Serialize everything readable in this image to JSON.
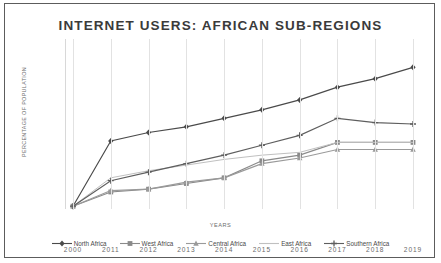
{
  "chart_data": {
    "type": "line",
    "title": "INTERNET USERS:  AFRICAN SUB-REGIONS",
    "xlabel": "YEARS",
    "ylabel": "PERCENTAGE OF POPULATION",
    "categories": [
      "2000",
      "2011",
      "2012",
      "2013",
      "2014",
      "2015",
      "2016",
      "2017",
      "2018",
      "2019"
    ],
    "yticks": [
      "0",
      "10",
      "20",
      "30",
      "40",
      "50",
      "60"
    ],
    "ylim": [
      0,
      60
    ],
    "grid": "vertical",
    "legend_position": "bottom",
    "series": [
      {
        "name": "North Africa",
        "marker": "diamond",
        "color": "#4a4a4a",
        "values": [
          1,
          24,
          27,
          29,
          32,
          35,
          38.5,
          43,
          46,
          50
        ]
      },
      {
        "name": "West Africa",
        "marker": "square",
        "color": "#8a8a8a",
        "values": [
          1,
          6,
          7,
          9,
          11,
          17,
          19,
          23.5,
          23.5,
          23.5
        ]
      },
      {
        "name": "Central Africa",
        "marker": "triangle",
        "color": "#9a9a9a",
        "values": [
          1,
          6.5,
          7,
          9.5,
          11,
          16,
          18,
          21,
          21,
          21
        ]
      },
      {
        "name": "East Africa",
        "marker": "none",
        "color": "#c0c0c0",
        "values": [
          1,
          11,
          13.5,
          15.5,
          17.5,
          19,
          20,
          23.5,
          23.5,
          23.5
        ]
      },
      {
        "name": "Southern Africa",
        "marker": "cross",
        "color": "#5e5e5e",
        "values": [
          1,
          10,
          13,
          16,
          19,
          22.5,
          26,
          32,
          30.5,
          30
        ]
      }
    ]
  }
}
